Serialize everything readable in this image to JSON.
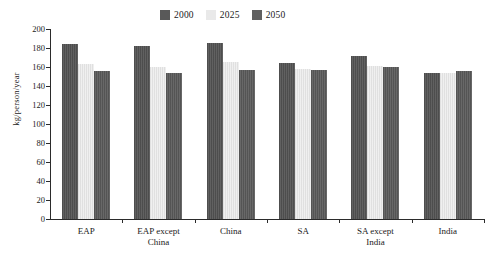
{
  "chart_data": {
    "type": "bar",
    "title": "",
    "xlabel": "",
    "ylabel": "kg/person/year",
    "ylim": [
      0,
      200
    ],
    "ytick_step": 20,
    "yticks": [
      0,
      20,
      40,
      60,
      80,
      100,
      120,
      140,
      160,
      180,
      200
    ],
    "grid": false,
    "legend_position": "top-center",
    "categories": [
      "EAP",
      "EAP except\nChina",
      "China",
      "SA",
      "SA except\nIndia",
      "India"
    ],
    "series": [
      {
        "name": "2000",
        "color": "#595959",
        "values": [
          184,
          182,
          185,
          164,
          172,
          154
        ]
      },
      {
        "name": "2025",
        "color": "#e9e9e9",
        "values": [
          163,
          160,
          165,
          158,
          161,
          154
        ]
      },
      {
        "name": "2050",
        "color": "#606060",
        "values": [
          156,
          154,
          157,
          157,
          160,
          156
        ]
      }
    ]
  },
  "legend": {
    "items": [
      {
        "label": "2000",
        "color": "#595959"
      },
      {
        "label": "2025",
        "color": "#e9e9e9"
      },
      {
        "label": "2050",
        "color": "#606060"
      }
    ]
  },
  "axes": {
    "y_title": "kg/person/year"
  }
}
